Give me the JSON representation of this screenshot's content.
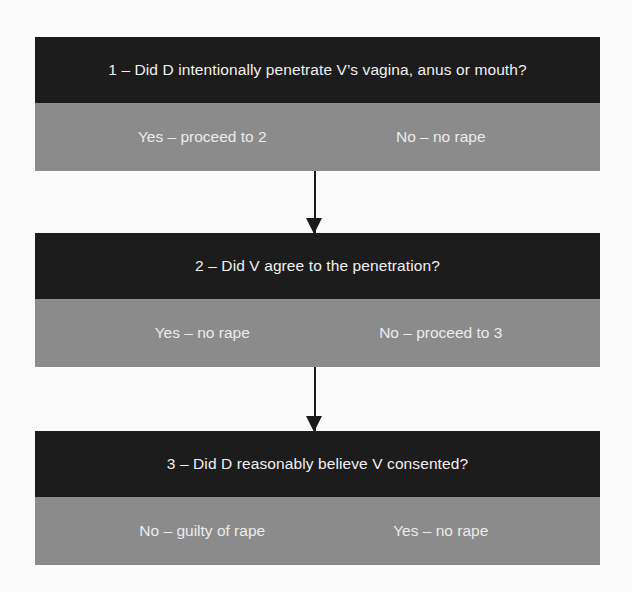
{
  "steps": [
    {
      "question": "1 – Did D intentionally penetrate V’s vagina, anus or mouth?",
      "answers": [
        "Yes – proceed to 2",
        "No – no rape"
      ]
    },
    {
      "question": "2 – Did V agree to the penetration?",
      "answers": [
        "Yes – no rape",
        "No – proceed to 3"
      ]
    },
    {
      "question": "3 – Did D reasonably believe V consented?",
      "answers": [
        "No – guilty of rape",
        "Yes – no rape"
      ]
    }
  ],
  "colors": {
    "question_bg": "#1c1c1c",
    "answer_bg": "#8b8b8b",
    "arrow": "#1a1a1a"
  }
}
